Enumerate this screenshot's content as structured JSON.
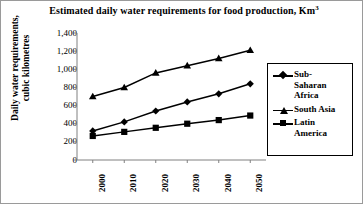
{
  "chart_data": {
    "type": "line",
    "title": "Estimated daily water requirements for food production, Km3",
    "title_main": "Estimated daily water requirements for food production, Km",
    "title_sup": "3",
    "xlabel": "",
    "ylabel": "Daily water requirements, cubic kilometres",
    "categories": [
      "2000",
      "2010",
      "2020",
      "2030",
      "2040",
      "2050"
    ],
    "x": [
      2000,
      2010,
      2020,
      2030,
      2040,
      2050
    ],
    "ylim": [
      0,
      1400
    ],
    "ytick_values": [
      0,
      200,
      400,
      600,
      800,
      1000,
      1200,
      1400
    ],
    "ytick_labels": [
      "0",
      "200",
      "400",
      "600",
      "800",
      "1,000",
      "1,200",
      "1,400"
    ],
    "grid": false,
    "legend_position": "right",
    "series": [
      {
        "name": "Sub-Saharan Africa",
        "name_lines": [
          "Sub-",
          "Saharan",
          "Africa"
        ],
        "marker": "diamond",
        "color": "#000000",
        "values": [
          320,
          420,
          540,
          640,
          730,
          840
        ]
      },
      {
        "name": "South Asia",
        "name_lines": [
          "South Asia"
        ],
        "marker": "triangle",
        "color": "#000000",
        "values": [
          700,
          800,
          960,
          1040,
          1120,
          1210
        ]
      },
      {
        "name": "Latin America",
        "name_lines": [
          "Latin",
          "America"
        ],
        "marker": "square",
        "color": "#000000",
        "values": [
          265,
          310,
          355,
          400,
          440,
          490
        ]
      }
    ]
  },
  "legend": {
    "items": [
      {
        "label_lines": [
          "Sub-",
          "Saharan",
          "Africa"
        ],
        "marker": "diamond"
      },
      {
        "label_lines": [
          "South Asia"
        ],
        "marker": "triangle"
      },
      {
        "label_lines": [
          "Latin",
          "America"
        ],
        "marker": "square"
      }
    ]
  }
}
